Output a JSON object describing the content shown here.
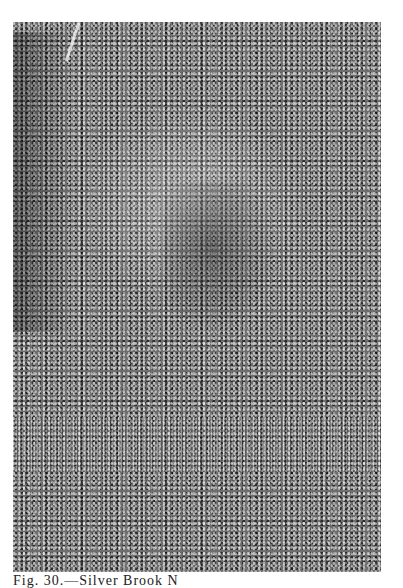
{
  "figure": {
    "type": "halftone-photomicrograph",
    "caption": "Fig. 30.—Silver Brook N"
  }
}
